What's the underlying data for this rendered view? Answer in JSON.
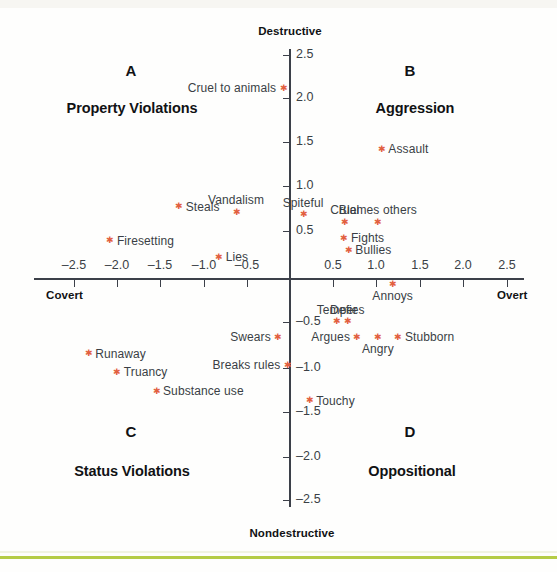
{
  "chart_data": {
    "type": "scatter",
    "title": "",
    "xlabel": "",
    "ylabel": "",
    "grid": false,
    "legend": "none",
    "xlim": [
      -2.75,
      2.75
    ],
    "ylim": [
      -2.75,
      2.75
    ],
    "x_ticks": [
      "-2.5",
      "-2.0",
      "-1.5",
      "-1.0",
      "-0.5",
      "0.5",
      "1.0",
      "1.5",
      "2.0",
      "2.5"
    ],
    "x_tick_values": [
      -2.5,
      -2.0,
      -1.5,
      -1.0,
      -0.5,
      0.5,
      1.0,
      1.5,
      2.0,
      2.5
    ],
    "y_ticks": [
      "2.5",
      "2.0",
      "1.5",
      "1.0",
      "0.5",
      "-0.5",
      "-1.0",
      "-1.5",
      "-2.0",
      "-2.5"
    ],
    "y_tick_values": [
      2.5,
      2.0,
      1.5,
      1.0,
      0.5,
      -0.5,
      -1.0,
      -1.5,
      -2.0,
      -2.5
    ],
    "axis_poles": {
      "top": "Destructive",
      "bottom": "Nondestructive",
      "left": "Covert",
      "right": "Overt"
    },
    "quadrants": [
      {
        "letter": "A",
        "name": "Property Violations"
      },
      {
        "letter": "B",
        "name": "Aggression"
      },
      {
        "letter": "C",
        "name": "Status Violations"
      },
      {
        "letter": "D",
        "name": "Oppositional"
      }
    ],
    "point_color": "#e2603f",
    "points": [
      {
        "label": "Cruel to animals",
        "x": -0.08,
        "y": 2.19,
        "label_pos": "left"
      },
      {
        "label": "Assault",
        "x": 1.05,
        "y": 1.49,
        "label_pos": "right"
      },
      {
        "label": "Vandalism",
        "x": -0.62,
        "y": 0.77,
        "label_pos": "above"
      },
      {
        "label": "Steals",
        "x": -1.28,
        "y": 0.83,
        "label_pos": "right"
      },
      {
        "label": "Spiteful",
        "x": 0.15,
        "y": 0.74,
        "label_pos": "above"
      },
      {
        "label": "Cruel",
        "x": 0.63,
        "y": 0.65,
        "label_pos": "above"
      },
      {
        "label": "Blames others",
        "x": 1.01,
        "y": 0.65,
        "label_pos": "above"
      },
      {
        "label": "Fights",
        "x": 0.62,
        "y": 0.47,
        "label_pos": "right"
      },
      {
        "label": "Bullies",
        "x": 0.67,
        "y": 0.33,
        "label_pos": "right"
      },
      {
        "label": "Firesetting",
        "x": -2.07,
        "y": 0.44,
        "label_pos": "right"
      },
      {
        "label": "Lies",
        "x": -0.82,
        "y": 0.25,
        "label_pos": "right"
      },
      {
        "label": "Annoys",
        "x": 1.18,
        "y": -0.06,
        "label_pos": "below"
      },
      {
        "label": "Temper",
        "x": 0.54,
        "y": -0.49,
        "label_pos": "above"
      },
      {
        "label": "Defies",
        "x": 0.66,
        "y": -0.49,
        "label_pos": "above"
      },
      {
        "label": "Argues",
        "x": 0.77,
        "y": -0.67,
        "label_pos": "left"
      },
      {
        "label": "Angry",
        "x": 1.01,
        "y": -0.67,
        "label_pos": "below"
      },
      {
        "label": "Stubborn",
        "x": 1.24,
        "y": -0.67,
        "label_pos": "right"
      },
      {
        "label": "Swears",
        "x": -0.14,
        "y": -0.67,
        "label_pos": "left"
      },
      {
        "label": "Breaks rules",
        "x": -0.03,
        "y": -0.99,
        "label_pos": "left"
      },
      {
        "label": "Runaway",
        "x": -2.32,
        "y": -0.86,
        "label_pos": "right"
      },
      {
        "label": "Truancy",
        "x": -1.99,
        "y": -1.07,
        "label_pos": "right"
      },
      {
        "label": "Substance use",
        "x": -1.54,
        "y": -1.29,
        "label_pos": "right"
      },
      {
        "label": "Touchy",
        "x": 0.22,
        "y": -1.4,
        "label_pos": "right"
      }
    ]
  },
  "ticks_x": [
    {
      "label": "-2.5",
      "px": 74
    },
    {
      "label": "-2.0",
      "px": 117
    },
    {
      "label": "-1.5",
      "px": 160
    },
    {
      "label": "-1.0",
      "px": 204
    },
    {
      "label": "-0.5",
      "px": 247
    },
    {
      "label": "0.5",
      "px": 333
    },
    {
      "label": "1.0",
      "px": 376
    },
    {
      "label": "1.5",
      "px": 420
    },
    {
      "label": "2.0",
      "px": 463
    },
    {
      "label": "2.5",
      "px": 507
    }
  ],
  "ticks_y": [
    {
      "label": "2.5",
      "py": 55
    },
    {
      "label": "2.0",
      "py": 98
    },
    {
      "label": "1.5",
      "py": 142
    },
    {
      "label": "1.0",
      "py": 186
    },
    {
      "label": "0.5",
      "py": 231
    },
    {
      "label": "-0.5",
      "py": 322
    },
    {
      "label": "-1.0",
      "py": 368
    },
    {
      "label": "-1.5",
      "py": 412
    },
    {
      "label": "-2.0",
      "py": 457
    },
    {
      "label": "-2.5",
      "py": 500
    }
  ],
  "poles": {
    "top": "Destructive",
    "bottom": "Nondestructive",
    "left": "Covert",
    "right": "Overt"
  },
  "quadrant_a": {
    "letter": "A",
    "name": "Property Violations"
  },
  "quadrant_b": {
    "letter": "B",
    "name": "Aggression"
  },
  "quadrant_c": {
    "letter": "C",
    "name": "Status Violations"
  },
  "quadrant_d": {
    "letter": "D",
    "name": "Oppositional"
  }
}
